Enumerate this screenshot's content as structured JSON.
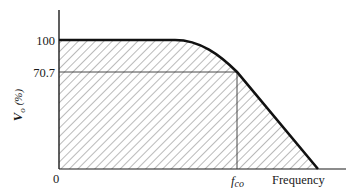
{
  "diagram": {
    "y_axis": {
      "label_main": "V",
      "label_sub": "o",
      "label_unit": "(%)",
      "ticks": [
        {
          "label": "100",
          "value": 100
        },
        {
          "label": "70.7",
          "value": 70.7
        }
      ]
    },
    "x_axis": {
      "origin_label": "0",
      "cutoff_label_f": "f",
      "cutoff_label_sub": "co",
      "axis_label": "Frequency"
    },
    "colors": {
      "ink": "#1a1a1a",
      "hatch": "#555555",
      "background": "#ffffff"
    }
  }
}
